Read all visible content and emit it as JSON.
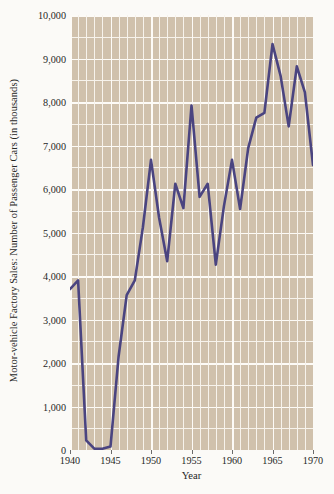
{
  "chart": {
    "title": "",
    "ylabel": "Motor-vehicle Factory Sales: Number of Passenger Cars (in thousands)",
    "xlabel": "Year",
    "yticks": [
      "0",
      "1,000",
      "2,000",
      "3,000",
      "4,000",
      "5,000",
      "6,000",
      "7,000",
      "8,000",
      "9,000",
      "10,000"
    ],
    "xticks": [
      "1940",
      "1945",
      "1950",
      "1955",
      "1960",
      "1965",
      "1970"
    ],
    "line_color": "#4a4480",
    "plot_background_color": "#d0c1ac",
    "grid_color": "#f7f3ec",
    "page_background_color": "#fbfaf7"
  },
  "chart_data": {
    "type": "line",
    "title": "",
    "xlabel": "Year",
    "ylabel": "Motor-vehicle Factory Sales: Number of Passenger Cars (in thousands)",
    "xlim": [
      1940,
      1970
    ],
    "ylim": [
      0,
      10000
    ],
    "xtick_values": [
      1940,
      1945,
      1950,
      1955,
      1960,
      1965,
      1970
    ],
    "xtick_labels": [
      "1940",
      "1945",
      "1950",
      "1955",
      "1960",
      "1965",
      "1970"
    ],
    "ytick_values": [
      0,
      1000,
      2000,
      3000,
      4000,
      5000,
      6000,
      7000,
      8000,
      9000,
      10000
    ],
    "ytick_labels": [
      "0",
      "1,000",
      "2,000",
      "3,000",
      "4,000",
      "5,000",
      "6,000",
      "7,000",
      "8,000",
      "9,000",
      "10,000"
    ],
    "grid": true,
    "legend": false,
    "x": [
      1940,
      1941,
      1942,
      1943,
      1944,
      1945,
      1946,
      1947,
      1948,
      1949,
      1950,
      1951,
      1952,
      1953,
      1954,
      1955,
      1956,
      1957,
      1958,
      1959,
      1960,
      1961,
      1962,
      1963,
      1964,
      1965,
      1966,
      1967,
      1968,
      1969,
      1970
    ],
    "values": [
      3700,
      3900,
      220,
      30,
      30,
      80,
      2150,
      3560,
      3900,
      5120,
      6670,
      5340,
      4340,
      6120,
      5560,
      7920,
      5820,
      6120,
      4260,
      5600,
      6670,
      5540,
      6940,
      7640,
      7750,
      9330,
      8600,
      7440,
      8820,
      8220,
      6550
    ],
    "series": [
      {
        "name": "Passenger cars (thousands)",
        "color": "#4a4480",
        "values": [
          3700,
          3900,
          220,
          30,
          30,
          80,
          2150,
          3560,
          3900,
          5120,
          6670,
          5340,
          4340,
          6120,
          5560,
          7920,
          5820,
          6120,
          4260,
          5600,
          6670,
          5540,
          6940,
          7640,
          7750,
          9330,
          8600,
          7440,
          8820,
          8220,
          6550
        ]
      }
    ],
    "annotations": []
  }
}
